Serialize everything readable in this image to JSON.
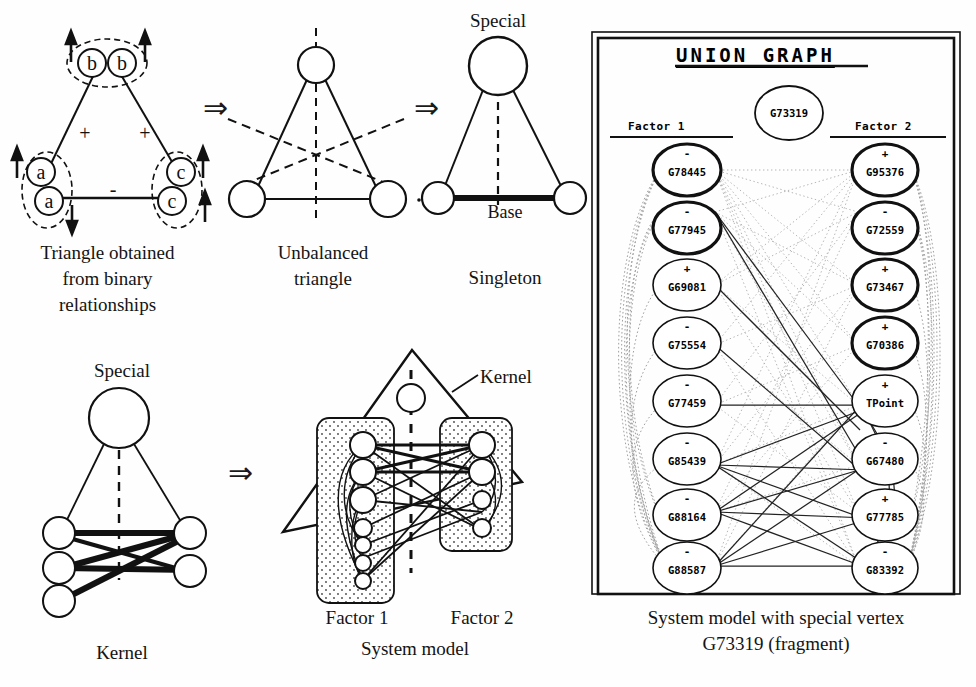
{
  "figure": {
    "panels": [
      {
        "id": "triangle-binary",
        "caption": "Triangle obtained\nfrom binary\nrelationships",
        "caption_lines": [
          "Triangle obtained",
          "from binary",
          "relationships"
        ],
        "vertex_labels": [
          "b",
          "b",
          "a",
          "a",
          "c",
          "c"
        ],
        "edge_signs": [
          "+",
          "+",
          "-"
        ]
      },
      {
        "id": "unbalanced-triangle",
        "caption_lines": [
          "Unbalanced",
          "triangle"
        ]
      },
      {
        "id": "singleton",
        "caption_lines": [
          "Singleton"
        ],
        "top_label": "Special",
        "base_label": "Base"
      },
      {
        "id": "kernel",
        "caption_lines": [
          "Kernel"
        ],
        "top_label": "Special"
      },
      {
        "id": "system-model",
        "caption_lines": [
          "System model"
        ],
        "kernel_label": "Kernel",
        "factor1_label": "Factor 1",
        "factor2_label": "Factor 2"
      }
    ],
    "arrows": [
      "arrow-1",
      "arrow-2",
      "arrow-3"
    ]
  },
  "union_panel": {
    "title": "UNION GRAPH",
    "center_node": {
      "label": "G73319"
    },
    "factor1": {
      "header": "Factor 1",
      "nodes": [
        {
          "label": "G78445",
          "sign": "-",
          "bold": true
        },
        {
          "label": "G77945",
          "sign": "-",
          "bold": true
        },
        {
          "label": "G69081",
          "sign": "+",
          "bold": false
        },
        {
          "label": "G75554",
          "sign": "-",
          "bold": false
        },
        {
          "label": "G77459",
          "sign": "-",
          "bold": false
        },
        {
          "label": "G85439",
          "sign": "-",
          "bold": false
        },
        {
          "label": "G88164",
          "sign": "-",
          "bold": false
        },
        {
          "label": "G88587",
          "sign": "-",
          "bold": false
        }
      ]
    },
    "factor2": {
      "header": "Factor 2",
      "nodes": [
        {
          "label": "G95376",
          "sign": "+",
          "bold": true
        },
        {
          "label": "G72559",
          "sign": "-",
          "bold": true
        },
        {
          "label": "G73467",
          "sign": "+",
          "bold": true
        },
        {
          "label": "G70386",
          "sign": "+",
          "bold": true
        },
        {
          "label": "TPoint",
          "sign": "+",
          "bold": false
        },
        {
          "label": "G67480",
          "sign": "-",
          "bold": false
        },
        {
          "label": "G77785",
          "sign": "+",
          "bold": false
        },
        {
          "label": "G83392",
          "sign": "-",
          "bold": false
        }
      ]
    },
    "caption_lines": [
      "System model with special vertex",
      "G73319 (fragment)"
    ]
  },
  "colors": {
    "ink": "#141414",
    "paper": "#fefefe",
    "faint_edge": "#9a9a9a",
    "bold_edge": "#000000"
  }
}
